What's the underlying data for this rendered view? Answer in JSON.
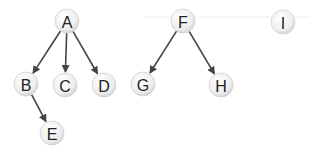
{
  "diagram": {
    "type": "forest",
    "nodes": [
      {
        "id": "A",
        "label": "A",
        "x": 67,
        "y": 21
      },
      {
        "id": "B",
        "label": "B",
        "x": 26,
        "y": 84
      },
      {
        "id": "C",
        "label": "C",
        "x": 65,
        "y": 85
      },
      {
        "id": "D",
        "label": "D",
        "x": 104,
        "y": 85
      },
      {
        "id": "E",
        "label": "E",
        "x": 52,
        "y": 133
      },
      {
        "id": "F",
        "label": "F",
        "x": 183,
        "y": 21
      },
      {
        "id": "G",
        "label": "G",
        "x": 143,
        "y": 84
      },
      {
        "id": "H",
        "label": "H",
        "x": 221,
        "y": 85
      },
      {
        "id": "I",
        "label": "I",
        "x": 283,
        "y": 22
      }
    ],
    "edges": [
      {
        "from": "A",
        "to": "B"
      },
      {
        "from": "A",
        "to": "C"
      },
      {
        "from": "A",
        "to": "D"
      },
      {
        "from": "B",
        "to": "E"
      },
      {
        "from": "F",
        "to": "G"
      },
      {
        "from": "F",
        "to": "H"
      }
    ],
    "colors": {
      "edge": "#444444",
      "node_fill": "#efefef",
      "node_stroke": "#d0d0d0",
      "guide_line": "#ececec"
    }
  }
}
